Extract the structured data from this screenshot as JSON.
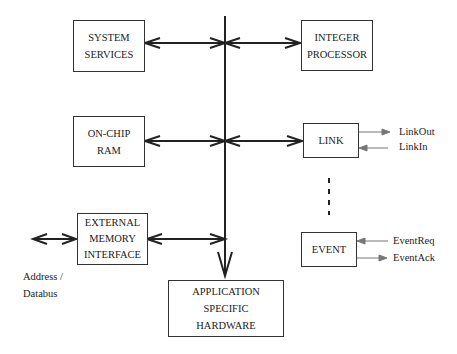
{
  "blocks": {
    "system_services": [
      "SYSTEM",
      "SERVICES"
    ],
    "integer_processor": [
      "INTEGER",
      "PROCESSOR"
    ],
    "on_chip_ram": [
      "ON-CHIP",
      "RAM"
    ],
    "link": [
      "LINK"
    ],
    "external_memory_interface": [
      "EXTERNAL",
      "MEMORY",
      "INTERFACE"
    ],
    "event": [
      "EVENT"
    ],
    "application_specific_hardware": [
      "APPLICATION",
      "SPECIFIC",
      "HARDWARE"
    ]
  },
  "signals": {
    "link_out": "LinkOut",
    "link_in": "LinkIn",
    "event_req": "EventReq",
    "event_ack": "EventAck",
    "address_databus": [
      "Address /",
      "Databus"
    ]
  }
}
